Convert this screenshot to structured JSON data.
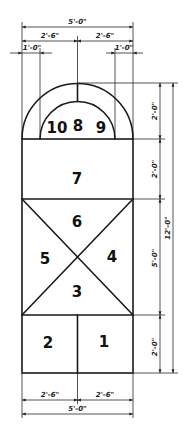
{
  "diagram": {
    "type": "floor-plan-layout",
    "line_color": "#1a1a1a",
    "background": "#ffffff",
    "regions": [
      {
        "id": "r1",
        "label": "1"
      },
      {
        "id": "r2",
        "label": "2"
      },
      {
        "id": "r3",
        "label": "3"
      },
      {
        "id": "r4",
        "label": "4"
      },
      {
        "id": "r5",
        "label": "5"
      },
      {
        "id": "r6",
        "label": "6"
      },
      {
        "id": "r7",
        "label": "7"
      },
      {
        "id": "r8",
        "label": "8"
      },
      {
        "id": "r9",
        "label": "9"
      },
      {
        "id": "r10",
        "label": "10"
      }
    ],
    "dimensions": {
      "top": {
        "overall": "5'-0\"",
        "left_half": "2'-6\"",
        "right_half": "2'-6\"",
        "left_offset": "1'-0\"",
        "right_offset": "1'-0\""
      },
      "right": {
        "arch": "2'-0\"",
        "section7": "2'-0\"",
        "x_section": "5'-0\"",
        "bottom_section": "2'-0\"",
        "overall": "12'-0\""
      },
      "bottom": {
        "left_half": "2'-6\"",
        "right_half": "2'-6\"",
        "overall": "5'-0\""
      }
    }
  }
}
